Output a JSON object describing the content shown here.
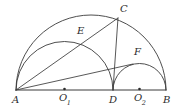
{
  "figure": {
    "kind": "geometry-diagram",
    "canvas": {
      "width": 178,
      "height": 112
    },
    "stroke_color": "#3a3a3a",
    "label_color": "#2b2b2b",
    "background_color": "#ffffff"
  },
  "labels": {
    "A": "A",
    "B": "B",
    "C": "C",
    "D": "D",
    "E": "E",
    "F": "F",
    "O1_main": "O",
    "O1_sub": "1",
    "O2_main": "O",
    "O2_sub": "2"
  },
  "points": {
    "A": {
      "x": 16.0,
      "y": 90.0
    },
    "B": {
      "x": 166.0,
      "y": 90.0
    },
    "D": {
      "x": 113.0,
      "y": 90.0
    },
    "O1": {
      "x": 64.5,
      "y": 90.0
    },
    "O2": {
      "x": 139.5,
      "y": 90.0
    },
    "C": {
      "x": 118.0,
      "y": 18.0
    },
    "E": {
      "x": 88.0,
      "y": 38.5
    },
    "F": {
      "x": 133.0,
      "y": 64.0
    }
  },
  "arcs": {
    "semicircle_AB": {
      "center_x": 91.0,
      "center_y": 90.0,
      "radius": 75.0
    },
    "semicircle_AD": {
      "center_x": 64.5,
      "center_y": 90.0,
      "radius": 48.5
    },
    "semicircle_DB": {
      "center_x": 139.5,
      "center_y": 90.0,
      "radius": 26.5
    }
  },
  "segments": {
    "baseline_AB": {
      "from": "A",
      "to": "B"
    },
    "chord_CD": {
      "from": "C",
      "to": "D"
    },
    "chord_AF": {
      "from": "A",
      "to": "F"
    },
    "chord_AC": {
      "from": "A",
      "to": "C"
    }
  }
}
